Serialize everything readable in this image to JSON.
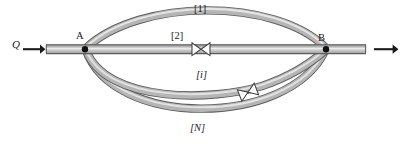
{
  "diagram": {
    "inlet": {
      "flow_label": "Q",
      "flow_label_style": "italic",
      "arrow": "right-arrow"
    },
    "outlet": {
      "flow_label": "",
      "arrow": "right-arrow"
    },
    "nodes": [
      {
        "id": "A",
        "label": "A",
        "x": 84,
        "y": 49,
        "marker": "filled-dot"
      },
      {
        "id": "B",
        "label": "B",
        "x": 326,
        "y": 49,
        "marker": "filled-dot"
      }
    ],
    "branches": [
      {
        "id": "1",
        "label": "[1]",
        "label_italic": false,
        "position": "top-arc",
        "has_valve": false
      },
      {
        "id": "2",
        "label": "[2]",
        "label_italic": false,
        "position": "straight",
        "has_valve": true
      },
      {
        "id": "i",
        "label": "[i]",
        "label_italic": true,
        "position": "lower-arc",
        "has_valve": true
      },
      {
        "id": "N",
        "label": "[N]",
        "label_italic": true,
        "position": "bottom-arc",
        "has_valve": false
      }
    ],
    "valves": [
      {
        "on_branch": "2",
        "symbol": "butterfly-valve-bowtie",
        "x": 201,
        "y": 49,
        "angle": 0
      },
      {
        "on_branch": "i",
        "symbol": "butterfly-valve-bowtie",
        "x": 248,
        "y": 93,
        "angle": -25
      }
    ],
    "colors": {
      "pipe_fill_light": "#e8e8e8",
      "pipe_fill_mid": "#b9b9b9",
      "pipe_fill_dark": "#8e8e8e",
      "pipe_outline": "#5d5d5d",
      "node_marker": "#111111",
      "arrow": "#1a1a1a",
      "label_text": "#1a1a1a",
      "background": "#ffffff"
    }
  }
}
